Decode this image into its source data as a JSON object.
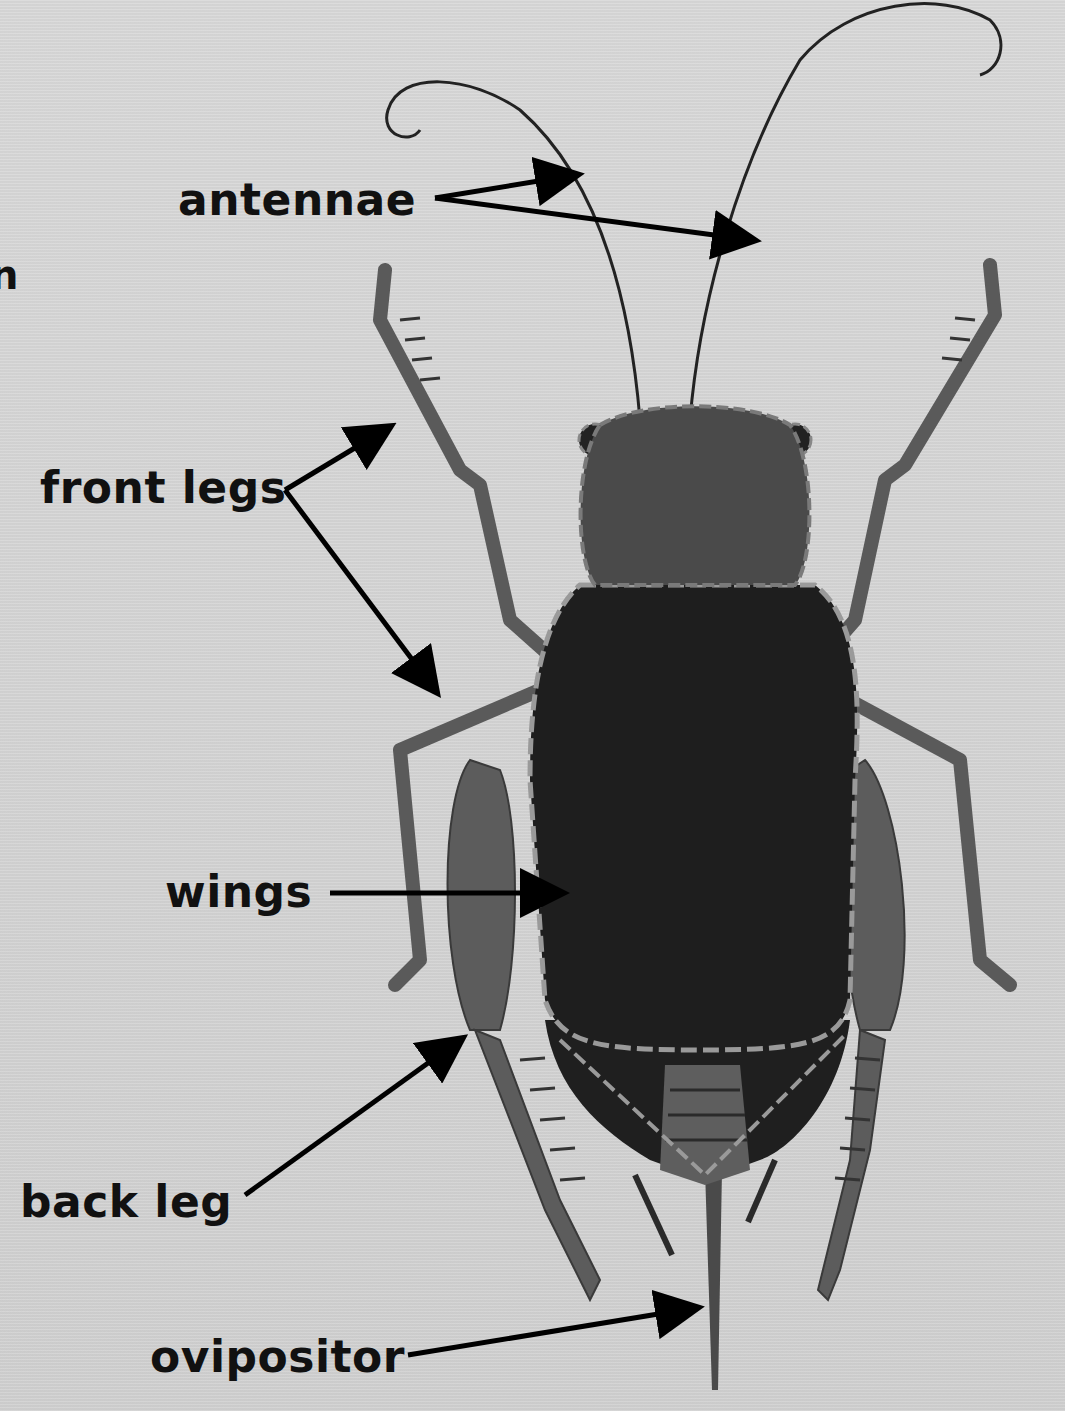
{
  "diagram": {
    "labels": {
      "antennae": "antennae",
      "front_legs": "front legs",
      "wings": "wings",
      "back_leg": "back leg",
      "ovipositor": "ovipositor"
    },
    "edge_fragment": "n",
    "colors": {
      "background": "#d4d4d4",
      "head": "#4a4a4a",
      "wings": "#1e1e1e",
      "legs": "#5a5a5a",
      "dashed_outline": "#9a9a9a",
      "arrow": "#000000"
    }
  }
}
